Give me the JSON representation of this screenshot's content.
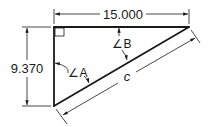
{
  "diagram": {
    "type": "right-triangle-dimensioned",
    "colors": {
      "ink": "#1a1a1a",
      "background": "#ffffff"
    },
    "dimensions": {
      "top_length": "15.000",
      "left_height": "9.370",
      "hypotenuse_label": "c"
    },
    "angles": {
      "angle_a_label": "∠A",
      "angle_b_label": "∠B"
    },
    "right_angle_marker": true
  }
}
